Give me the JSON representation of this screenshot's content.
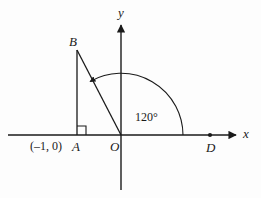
{
  "figure": {
    "stroke_color": "#1a1a1a",
    "background_color": "#fdfdfd",
    "axes": {
      "x_label": "x",
      "y_label": "y",
      "origin_label": "O"
    },
    "points": [
      {
        "name": "B",
        "label": "B"
      },
      {
        "name": "A",
        "label": "A"
      },
      {
        "name": "O",
        "label": "O"
      },
      {
        "name": "D",
        "label": "D"
      }
    ],
    "annotations": {
      "coordinate_label": "(–1, 0)",
      "angle_label": "120°"
    },
    "marks": {
      "right_angle_at": "A",
      "dot_at": "D",
      "arc_direction": "counterclockwise"
    }
  },
  "geometry": {
    "origin": {
      "x": 121,
      "y": 135
    },
    "x_axis": {
      "x1": 8,
      "y1": 135,
      "x2": 239,
      "y2": 135
    },
    "y_axis": {
      "x1": 121,
      "y1": 22,
      "x2": 121,
      "y2": 190
    },
    "point_A": {
      "x": 77,
      "y": 135
    },
    "point_B": {
      "x": 77,
      "y": 50
    },
    "point_D": {
      "x": 210,
      "y": 135
    },
    "arc_radius": 62
  }
}
